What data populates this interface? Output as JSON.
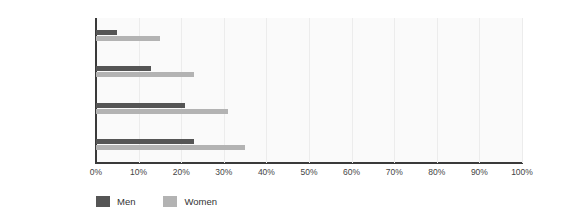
{
  "chart_data": {
    "type": "bar",
    "orientation": "horizontal",
    "title": "",
    "subtitle": "",
    "xlabel": "",
    "ylabel": "",
    "xlim": [
      0,
      100
    ],
    "xtick_labels": [
      "0%",
      "10%",
      "20%",
      "30%",
      "40%",
      "50%",
      "60%",
      "70%",
      "80%",
      "90%",
      "100%"
    ],
    "xtick_values": [
      0,
      10,
      20,
      30,
      40,
      50,
      60,
      70,
      80,
      90,
      100
    ],
    "categories": [
      "Primary",
      "Lower secondary",
      "Higher secondary",
      "Third level"
    ],
    "series": [
      {
        "name": "Men",
        "color": "#555555",
        "values": [
          5,
          13,
          21,
          23
        ]
      },
      {
        "name": "Women",
        "color": "#b3b3b3",
        "values": [
          15,
          23,
          31,
          35
        ]
      }
    ],
    "legend": {
      "position": "bottom-left",
      "entries": [
        {
          "label": "Men",
          "color": "#555555"
        },
        {
          "label": "Women",
          "color": "#b3b3b3"
        }
      ]
    },
    "grid": {
      "vertical": true,
      "horizontal": false,
      "color": "#ececec"
    },
    "plot_background": "#fafafa",
    "axis_color": "#3a3a3a"
  }
}
